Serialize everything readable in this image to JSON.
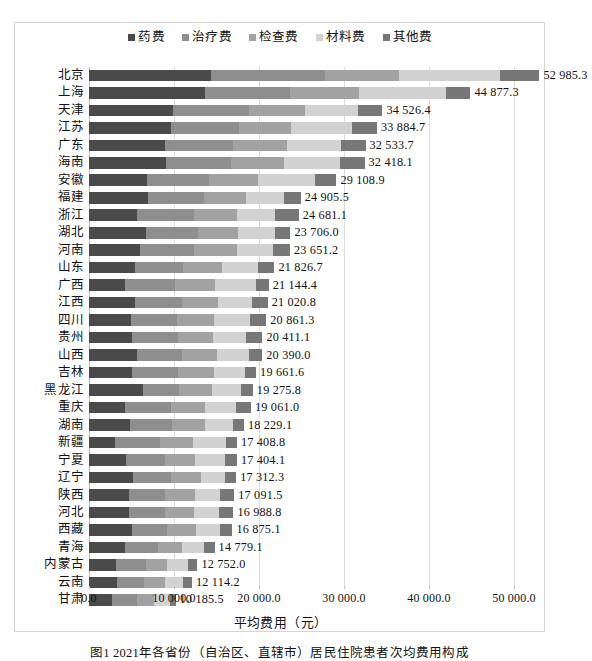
{
  "caption": "图1  2021年各省份（自治区、直辖市）居民住院患者次均费用构成",
  "axis": {
    "xlabel": "平均费用（元）",
    "xticks": [
      "0.0",
      "10 000.0",
      "20 000.0",
      "30 000.0",
      "40 000.0",
      "50 000.0"
    ],
    "xmin": 0,
    "xmax": 50000
  },
  "colors": {
    "drug": "#4a4a4a",
    "treatment": "#8e8e8e",
    "exam": "#a2a2a2",
    "material": "#d2d2d2",
    "other": "#777777",
    "gridline": "#dcdcdc",
    "frame": "#d6d6d6"
  },
  "chart_data": {
    "type": "bar",
    "orientation": "horizontal",
    "stacked": true,
    "title": "",
    "xlabel": "平均费用（元）",
    "ylabel": "",
    "xlim": [
      0,
      50000
    ],
    "grid": true,
    "legend_position": "top",
    "legend": [
      "药费",
      "治疗费",
      "检查费",
      "材料费",
      "其他费"
    ],
    "categories": [
      "北京",
      "上海",
      "天津",
      "江苏",
      "广东",
      "海南",
      "安徽",
      "福建",
      "浙江",
      "湖北",
      "河南",
      "山东",
      "广西",
      "江西",
      "四川",
      "贵州",
      "山西",
      "吉林",
      "黑龙江",
      "重庆",
      "湖南",
      "新疆",
      "宁夏",
      "辽宁",
      "陕西",
      "河北",
      "西藏",
      "青海",
      "内蒙古",
      "云南",
      "甘肃"
    ],
    "totals": [
      52985.3,
      44877.3,
      34526.4,
      33884.7,
      32533.7,
      32418.1,
      29108.9,
      24905.5,
      24681.1,
      23706.0,
      23651.2,
      21826.7,
      21144.4,
      21020.8,
      20861.3,
      20411.1,
      20390.0,
      19661.6,
      19275.8,
      19061.0,
      18229.1,
      17408.8,
      17404.1,
      17312.3,
      17091.5,
      16988.8,
      16875.1,
      14779.1,
      12752.0,
      12114.2,
      10185.5
    ],
    "total_labels": [
      "52 985.3",
      "44 877.3",
      "34 526.4",
      "33 884.7",
      "32 533.7",
      "32 418.1",
      "29 108.9",
      "24 905.5",
      "24 681.1",
      "23 706.0",
      "23 651.2",
      "21 826.7",
      "21 144.4",
      "21 020.8",
      "20 861.3",
      "20 411.1",
      "20 390.0",
      "19 661.6",
      "19 275.8",
      "19 061.0",
      "18 229.1",
      "17 408.8",
      "17 404.1",
      "17 312.3",
      "17 091.5",
      "16 988.8",
      "16 875.1",
      "14 779.1",
      "12 752.0",
      "12 114.2",
      "10 185.5"
    ],
    "series": [
      {
        "name": "药费",
        "values": [
          14300.0,
          13600.0,
          9900.0,
          9700.0,
          8900.0,
          9000.0,
          6800.0,
          6900.0,
          5700.0,
          6700.0,
          6000.0,
          5400.0,
          4200.0,
          5400.0,
          4900.0,
          5100.0,
          5600.0,
          5000.0,
          6300.0,
          4200.0,
          4800.0,
          3100.0,
          4300.0,
          5200.0,
          4700.0,
          4700.0,
          5000.0,
          4200.0,
          3200.0,
          3300.0,
          2700.0
        ]
      },
      {
        "name": "治疗费",
        "values": [
          13500.0,
          10100.0,
          8900.0,
          7900.0,
          8100.0,
          7700.0,
          7300.0,
          6600.0,
          6600.0,
          6100.0,
          6400.0,
          5700.0,
          5900.0,
          5500.0,
          5400.0,
          5400.0,
          5300.0,
          5500.0,
          4300.0,
          5500.0,
          5000.0,
          5200.0,
          4700.0,
          4500.0,
          4300.0,
          4300.0,
          4200.0,
          3900.0,
          3500.0,
          3200.0,
          2900.0
        ]
      },
      {
        "name": "检查费",
        "values": [
          8700.0,
          8100.0,
          6600.0,
          6200.0,
          6300.0,
          6200.0,
          5800.0,
          5000.0,
          5100.0,
          4700.0,
          5000.0,
          4600.0,
          4700.0,
          4300.0,
          4400.0,
          4100.0,
          4200.0,
          4200.0,
          3900.0,
          4000.0,
          3900.0,
          3900.0,
          3500.0,
          3500.0,
          3500.0,
          3300.0,
          3400.0,
          2800.0,
          2500.0,
          2400.0,
          2100.0
        ]
      },
      {
        "name": "材料费",
        "values": [
          11800.0,
          10200.0,
          6300.0,
          7200.0,
          6300.0,
          6600.0,
          6700.0,
          4500.0,
          4500.0,
          4400.0,
          4200.0,
          4200.0,
          4800.0,
          4000.0,
          4300.0,
          3900.0,
          3700.0,
          3600.0,
          3400.0,
          3600.0,
          3200.0,
          3900.0,
          3500.0,
          2800.0,
          2900.0,
          3000.0,
          2800.0,
          2600.0,
          2400.0,
          2200.0,
          1800.0
        ]
      },
      {
        "name": "其他费",
        "values": [
          4685.3,
          2877.3,
          2826.4,
          2884.7,
          2933.7,
          2918.1,
          2508.9,
          1905.5,
          2781.1,
          1806.0,
          2051.2,
          1926.7,
          1544.4,
          1820.8,
          1861.3,
          1911.1,
          1590.0,
          1361.6,
          1375.8,
          1761.0,
          1329.1,
          1308.8,
          1404.1,
          1312.3,
          1691.5,
          1688.8,
          1475.1,
          1279.1,
          1152.0,
          1014.2,
          685.5
        ]
      }
    ]
  }
}
